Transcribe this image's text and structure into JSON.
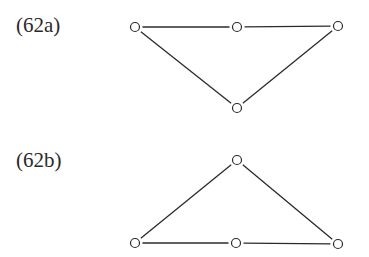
{
  "diagrams": [
    {
      "label": "(62a)",
      "nodes": [
        {
          "id": "a1",
          "x": 135,
          "y": 27
        },
        {
          "id": "a2",
          "x": 237,
          "y": 27
        },
        {
          "id": "a3",
          "x": 338,
          "y": 26
        },
        {
          "id": "a4",
          "x": 237,
          "y": 108
        }
      ],
      "edges": [
        [
          "a1",
          "a2"
        ],
        [
          "a2",
          "a3"
        ],
        [
          "a1",
          "a4"
        ],
        [
          "a3",
          "a4"
        ]
      ]
    },
    {
      "label": "(62b)",
      "nodes": [
        {
          "id": "b1",
          "x": 237,
          "y": 160
        },
        {
          "id": "b2",
          "x": 135,
          "y": 243
        },
        {
          "id": "b3",
          "x": 236,
          "y": 243
        },
        {
          "id": "b4",
          "x": 338,
          "y": 244
        }
      ],
      "edges": [
        [
          "b1",
          "b2"
        ],
        [
          "b1",
          "b4"
        ],
        [
          "b2",
          "b3"
        ],
        [
          "b3",
          "b4"
        ]
      ]
    }
  ],
  "style": {
    "stroke": "#2a2a2a",
    "node_radius": 4.5
  }
}
